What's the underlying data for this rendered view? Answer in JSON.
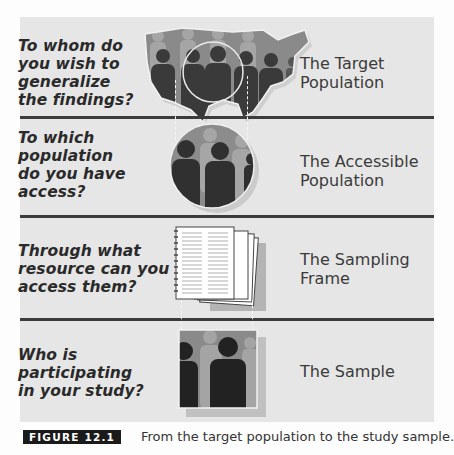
{
  "rows": [
    {
      "question_lines": [
        "To whom do",
        "you wish to",
        "generalize",
        "the findings?"
      ],
      "label_lines": [
        "The Target",
        "Population"
      ],
      "illustration": "us-map-crowd-icon"
    },
    {
      "question_lines": [
        "To which",
        "population",
        "do you have",
        "access?"
      ],
      "label_lines": [
        "The Accessible",
        "Population"
      ],
      "illustration": "circle-crowd-icon"
    },
    {
      "question_lines": [
        "Through what",
        "resource can you",
        "access them?"
      ],
      "label_lines": [
        "The Sampling",
        "Frame"
      ],
      "illustration": "document-stack-icon"
    },
    {
      "question_lines": [
        "Who is",
        "participating",
        "in your study?"
      ],
      "label_lines": [
        "The Sample"
      ],
      "illustration": "sample-photo-icon"
    }
  ],
  "caption": {
    "badge": "FIGURE 12.1",
    "text": "From the target population to the study sample."
  },
  "colors": {
    "panel": "#e6e6e6",
    "divider": "#3c3c3c",
    "badge": "#1a1a1a"
  }
}
